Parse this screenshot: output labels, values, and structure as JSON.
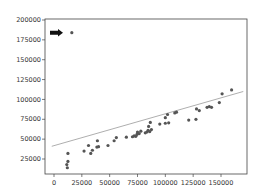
{
  "chart_data": {
    "type": "scatter",
    "title": "",
    "xlabel": "",
    "ylabel": "",
    "xlim": [
      -7000,
      172000
    ],
    "ylim": [
      7000,
      200000
    ],
    "grid": false,
    "legend": null,
    "x_ticks": [
      0,
      25000,
      50000,
      75000,
      100000,
      125000,
      150000
    ],
    "x_tick_labels": [
      "0",
      "25000",
      "50000",
      "75000",
      "100000",
      "125000",
      "150000"
    ],
    "y_ticks": [
      25000,
      50000,
      75000,
      100000,
      125000,
      150000,
      175000,
      200000
    ],
    "y_tick_labels": [
      "25000",
      "50000",
      "75000",
      "100000",
      "125000",
      "150000",
      "175000",
      "200000"
    ],
    "series": [
      {
        "name": "points",
        "color": "#555555",
        "points": [
          [
            16000,
            184000
          ],
          [
            11500,
            18000
          ],
          [
            12000,
            14000
          ],
          [
            12500,
            22000
          ],
          [
            12500,
            32000
          ],
          [
            27000,
            35000
          ],
          [
            31000,
            42000
          ],
          [
            33000,
            32000
          ],
          [
            34500,
            36000
          ],
          [
            38500,
            40000
          ],
          [
            39000,
            48000
          ],
          [
            40000,
            40500
          ],
          [
            48500,
            42000
          ],
          [
            54000,
            48000
          ],
          [
            56000,
            52000
          ],
          [
            65000,
            52500
          ],
          [
            70500,
            53000
          ],
          [
            72000,
            54000
          ],
          [
            73500,
            53500
          ],
          [
            74500,
            56000
          ],
          [
            75000,
            59000
          ],
          [
            76500,
            57000
          ],
          [
            78000,
            60000
          ],
          [
            82000,
            58000
          ],
          [
            83500,
            59000
          ],
          [
            84500,
            61000
          ],
          [
            85000,
            66000
          ],
          [
            86000,
            59500
          ],
          [
            86500,
            71000
          ],
          [
            87500,
            62000
          ],
          [
            95000,
            69000
          ],
          [
            100000,
            70000
          ],
          [
            100000,
            77000
          ],
          [
            102000,
            81000
          ],
          [
            103000,
            70500
          ],
          [
            108500,
            83000
          ],
          [
            110000,
            84000
          ],
          [
            121000,
            74000
          ],
          [
            127500,
            75000
          ],
          [
            128000,
            88000
          ],
          [
            130500,
            86000
          ],
          [
            137500,
            90000
          ],
          [
            139500,
            91000
          ],
          [
            141500,
            90000
          ],
          [
            148500,
            96000
          ],
          [
            151000,
            107000
          ],
          [
            159500,
            112000
          ]
        ]
      }
    ],
    "trendline": {
      "color": "#999999",
      "start": [
        -2000,
        41000
      ],
      "end": [
        170000,
        110000
      ]
    },
    "annotations": [
      {
        "type": "arrow",
        "direction": "right",
        "color": "#111111",
        "points_to": [
          16000,
          184000
        ]
      }
    ]
  }
}
